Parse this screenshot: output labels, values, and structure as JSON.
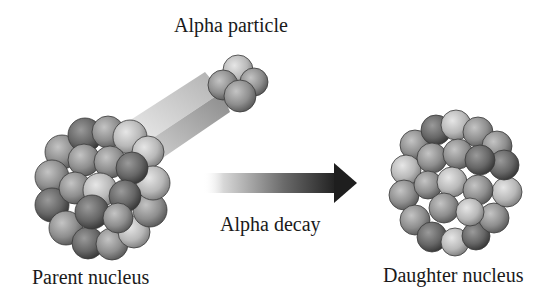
{
  "diagram": {
    "labels": {
      "alpha_particle": "Alpha particle",
      "alpha_decay": "Alpha decay",
      "parent_nucleus": "Parent nucleus",
      "daughter_nucleus": "Daughter nucleus"
    },
    "colors": {
      "background": "#ffffff",
      "sphere_light": "#d0d0d0",
      "sphere_mid": "#9a9a9a",
      "sphere_dark": "#5a5a5a",
      "arrow_dark": "#1e1e1e",
      "text": "#1a1a1a"
    }
  }
}
